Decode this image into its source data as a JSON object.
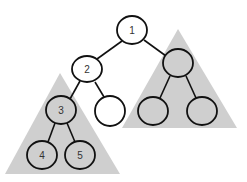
{
  "diagram": {
    "type": "binary-tree",
    "colors": {
      "triangle_fill": "#cfcfcf",
      "node_stroke": "#111111",
      "white_node_fill": "#ffffff",
      "subtree_node_fill": "#cfcfcf"
    },
    "nodes": [
      {
        "id": "n1",
        "label": "1"
      },
      {
        "id": "n2",
        "label": "2"
      },
      {
        "id": "n3",
        "label": "3"
      },
      {
        "id": "n4",
        "label": "4"
      },
      {
        "id": "n5",
        "label": "5"
      },
      {
        "id": "n-empty",
        "label": ""
      },
      {
        "id": "r-root",
        "label": ""
      },
      {
        "id": "r-left",
        "label": ""
      },
      {
        "id": "r-right",
        "label": ""
      }
    ],
    "subtrees": [
      {
        "id": "left-subtree",
        "root": "3"
      },
      {
        "id": "right-subtree",
        "root": "unlabeled"
      }
    ]
  }
}
